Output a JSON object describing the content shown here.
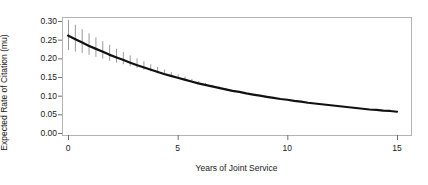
{
  "chart_data": {
    "type": "line",
    "title": "",
    "subtitle": "",
    "xlabel": "Years of Joint Service",
    "ylabel": "Expected Rate of Citation (mu)",
    "xlim": [
      -0.3,
      15.3
    ],
    "ylim": [
      0.0,
      0.305
    ],
    "grid": false,
    "legend": null,
    "xticks": [
      0,
      5,
      10,
      15
    ],
    "xtick_labels": [
      "0",
      "5",
      "10",
      "15"
    ],
    "yticks": [
      0.0,
      0.05,
      0.1,
      0.15,
      0.2,
      0.25,
      0.3
    ],
    "ytick_labels": [
      "0.00",
      "0.05",
      "0.10",
      "0.15",
      "0.20",
      "0.25",
      "0.30"
    ],
    "series": [
      {
        "name": "Expected rate of citation",
        "style": "solid-line-with-error-bars",
        "line_color": "#111111",
        "error_color": "#9a9a9a",
        "x": [
          0,
          0.3125,
          0.625,
          0.9375,
          1.25,
          1.5625,
          1.875,
          2.1875,
          2.5,
          2.8125,
          3.125,
          3.4375,
          3.75,
          4.0625,
          4.375,
          4.6875,
          5,
          5.3125,
          5.625,
          5.9375,
          6.25,
          6.5625,
          6.875,
          7.1875,
          7.5,
          7.8125,
          8.125,
          8.4375,
          8.75,
          9.0625,
          9.375,
          9.6875,
          10,
          10.3125,
          10.625,
          10.9375,
          11.25,
          11.5625,
          11.875,
          12.1875,
          12.5,
          12.8125,
          13.125,
          13.4375,
          13.75,
          14.0625,
          14.375,
          14.6875,
          15
        ],
        "y": [
          0.261,
          0.252,
          0.243,
          0.234,
          0.226,
          0.218,
          0.21,
          0.203,
          0.196,
          0.189,
          0.182,
          0.176,
          0.17,
          0.164,
          0.158,
          0.153,
          0.148,
          0.143,
          0.138,
          0.133,
          0.129,
          0.125,
          0.121,
          0.117,
          0.113,
          0.11,
          0.106,
          0.103,
          0.1,
          0.097,
          0.094,
          0.091,
          0.089,
          0.086,
          0.084,
          0.081,
          0.079,
          0.077,
          0.075,
          0.073,
          0.071,
          0.069,
          0.067,
          0.065,
          0.063,
          0.062,
          0.06,
          0.059,
          0.057
        ],
        "y_lower": [
          0.222,
          0.218,
          0.214,
          0.209,
          0.204,
          0.199,
          0.194,
          0.189,
          0.184,
          0.179,
          0.174,
          0.169,
          0.165,
          0.16,
          0.155,
          0.151,
          0.146,
          0.142,
          0.137,
          0.133,
          0.129,
          0.125,
          0.121,
          0.117,
          0.114,
          0.11,
          0.107,
          0.103,
          0.1,
          0.097,
          0.094,
          0.092,
          0.089,
          0.086,
          0.084,
          0.081,
          0.079,
          0.077,
          0.075,
          0.073,
          0.071,
          0.069,
          0.067,
          0.065,
          0.063,
          0.061,
          0.06,
          0.058,
          0.057
        ],
        "y_upper": [
          0.303,
          0.29,
          0.278,
          0.267,
          0.256,
          0.246,
          0.236,
          0.226,
          0.217,
          0.208,
          0.2,
          0.192,
          0.184,
          0.177,
          0.17,
          0.163,
          0.157,
          0.151,
          0.145,
          0.139,
          0.134,
          0.129,
          0.124,
          0.12,
          0.115,
          0.111,
          0.107,
          0.104,
          0.1,
          0.097,
          0.094,
          0.091,
          0.089,
          0.086,
          0.084,
          0.081,
          0.079,
          0.077,
          0.075,
          0.073,
          0.071,
          0.069,
          0.067,
          0.065,
          0.064,
          0.062,
          0.06,
          0.059,
          0.057
        ]
      }
    ]
  },
  "axes": {
    "frame_color": "#b4b4b4",
    "tick_color": "#6e6e6e"
  }
}
